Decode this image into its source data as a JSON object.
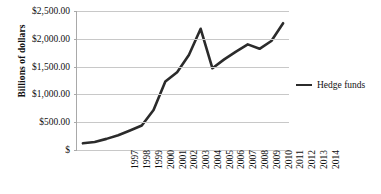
{
  "chart_data": {
    "type": "line",
    "title": "",
    "subtitle": "",
    "xlabel": "",
    "ylabel": "Billions of dollars",
    "categories": [
      "1997",
      "1998",
      "1999",
      "2000",
      "2001",
      "2002",
      "2003",
      "2004",
      "2005",
      "2006",
      "2007",
      "2008",
      "2009",
      "2010",
      "2011",
      "2012",
      "2013",
      "2014"
    ],
    "series": [
      {
        "name": "Hedge funds",
        "color": "#2b2b2b",
        "values": [
          120,
          145,
          200,
          265,
          350,
          440,
          720,
          1230,
          1400,
          1710,
          2180,
          1470,
          1630,
          1770,
          1900,
          1820,
          1960,
          2280
        ]
      }
    ],
    "ylim": [
      0,
      2500
    ],
    "y_ticks": [
      0,
      500,
      1000,
      1500,
      2000,
      2500
    ],
    "y_tick_labels": [
      "$",
      "$500.00",
      "$1,000.00",
      "$1,500.00",
      "$2,000.00",
      "$2,500.00"
    ],
    "grid": true,
    "grid_color": "#c8c8c8",
    "axis_color": "#a9a9a9",
    "legend_position": "right",
    "legend_entries": [
      "Hedge funds"
    ]
  },
  "axes": {
    "y_title": "Billions of dollars"
  },
  "legend": {
    "entries": [
      {
        "label": "Hedge funds"
      }
    ]
  }
}
